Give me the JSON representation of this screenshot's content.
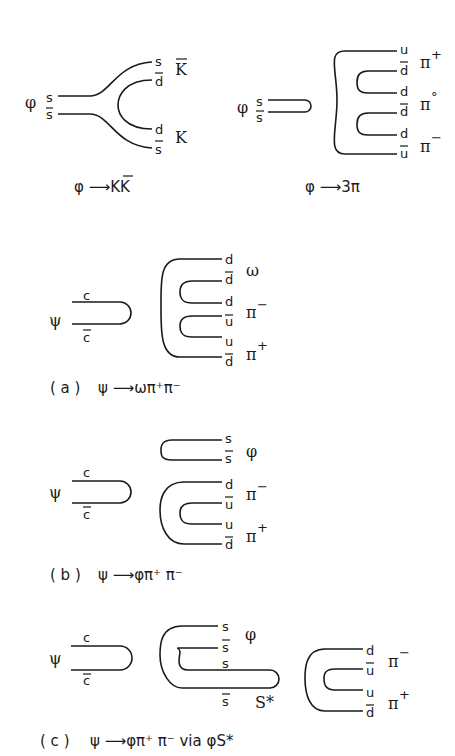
{
  "diagrams": {
    "phi_KKbar": {
      "parent": "φ",
      "in_quarks": [
        "s",
        "s̄"
      ],
      "out": [
        {
          "quarks": [
            "s",
            "d̄"
          ],
          "meson": "K̄"
        },
        {
          "quarks": [
            "d",
            "s̄"
          ],
          "meson": "K"
        }
      ],
      "caption": "φ ⟶ KK̄"
    },
    "phi_3pi": {
      "parent": "φ",
      "in_quarks": [
        "s",
        "s̄"
      ],
      "out": [
        {
          "quarks": [
            "u",
            "d̄"
          ],
          "meson": "π⁺"
        },
        {
          "quarks": [
            "d",
            "d̄"
          ],
          "meson": "π°"
        },
        {
          "quarks": [
            "d",
            "ū"
          ],
          "meson": "π⁻"
        }
      ],
      "caption": "φ ⟶ 3π"
    },
    "a": {
      "parent": "ψ",
      "in_quarks": [
        "c",
        "c̄"
      ],
      "out": [
        {
          "quarks": [
            "d",
            "d̄"
          ],
          "meson": "ω"
        },
        {
          "quarks": [
            "d",
            "ū"
          ],
          "meson": "π⁻"
        },
        {
          "quarks": [
            "u",
            "d̄"
          ],
          "meson": "π⁺"
        }
      ],
      "label": "(a)",
      "caption": "ψ ⟶ ωπ⁺π⁻"
    },
    "b": {
      "parent": "ψ",
      "in_quarks": [
        "c",
        "c̄"
      ],
      "out": [
        {
          "quarks": [
            "s",
            "s̄"
          ],
          "meson": "φ"
        },
        {
          "quarks": [
            "d",
            "ū"
          ],
          "meson": "π⁻"
        },
        {
          "quarks": [
            "u",
            "d̄"
          ],
          "meson": "π⁺"
        }
      ],
      "label": "(b)",
      "caption": "ψ ⟶ φπ⁺π⁻"
    },
    "c": {
      "parent": "ψ",
      "in_quarks": [
        "c",
        "c̄"
      ],
      "out": [
        {
          "quarks": [
            "s",
            "s̄"
          ],
          "meson": "φ"
        },
        {
          "quarks": [
            "s",
            "s̄"
          ],
          "meson": "S*"
        },
        {
          "quarks": [
            "d",
            "ū"
          ],
          "meson": "π⁻"
        },
        {
          "quarks": [
            "u",
            "d̄"
          ],
          "meson": "π⁺"
        }
      ],
      "label": "(c)",
      "caption": "ψ ⟶ φπ⁺π⁻  via φS*"
    }
  }
}
